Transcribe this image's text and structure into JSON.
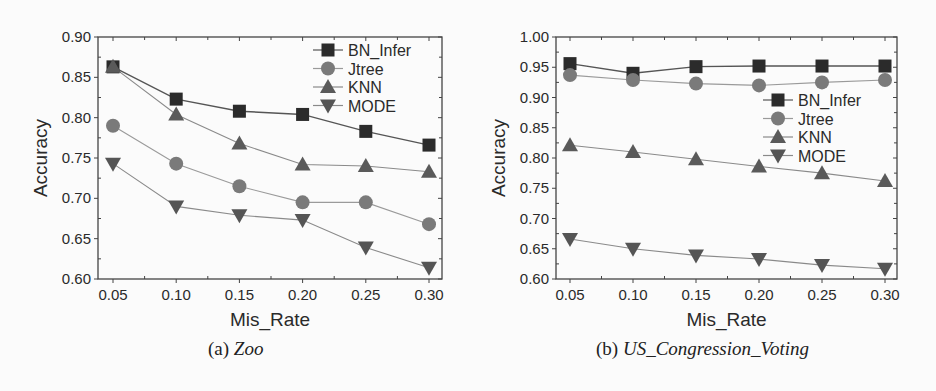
{
  "chart_data": [
    {
      "type": "line",
      "id": "zoo",
      "caption_label": "(a)",
      "caption_name": "Zoo",
      "xlabel": "Mis_Rate",
      "ylabel": "Accuracy",
      "x": [
        0.05,
        0.1,
        0.15,
        0.2,
        0.25,
        0.3
      ],
      "x_tick_labels": [
        "0.05",
        "0.10",
        "0.15",
        "0.20",
        "0.25",
        "0.30"
      ],
      "ylim": [
        0.6,
        0.9
      ],
      "y_ticks": [
        0.6,
        0.65,
        0.7,
        0.75,
        0.8,
        0.85,
        0.9
      ],
      "y_tick_labels": [
        "0.60",
        "0.65",
        "0.70",
        "0.75",
        "0.80",
        "0.85",
        "0.90"
      ],
      "grid": false,
      "legend_position": "upper right",
      "series": [
        {
          "name": "BN_Infer",
          "marker": "square",
          "values": [
            0.863,
            0.823,
            0.808,
            0.804,
            0.783,
            0.766
          ]
        },
        {
          "name": "Jtree",
          "marker": "circle",
          "values": [
            0.79,
            0.743,
            0.715,
            0.695,
            0.695,
            0.668
          ]
        },
        {
          "name": "KNN",
          "marker": "triangle-up",
          "values": [
            0.863,
            0.804,
            0.768,
            0.742,
            0.74,
            0.733
          ]
        },
        {
          "name": "MODE",
          "marker": "triangle-down",
          "values": [
            0.743,
            0.69,
            0.679,
            0.673,
            0.639,
            0.614
          ]
        }
      ]
    },
    {
      "type": "line",
      "id": "us_congression_voting",
      "caption_label": "(b)",
      "caption_name": "US_Congression_Voting",
      "xlabel": "Mis_Rate",
      "ylabel": "Accuracy",
      "x": [
        0.05,
        0.1,
        0.15,
        0.2,
        0.25,
        0.3
      ],
      "x_tick_labels": [
        "0.05",
        "0.10",
        "0.15",
        "0.20",
        "0.25",
        "0.30"
      ],
      "ylim": [
        0.6,
        1.0
      ],
      "y_ticks": [
        0.6,
        0.65,
        0.7,
        0.75,
        0.8,
        0.85,
        0.9,
        0.95,
        1.0
      ],
      "y_tick_labels": [
        "0.60",
        "0.65",
        "0.70",
        "0.75",
        "0.80",
        "0.85",
        "0.90",
        "0.95",
        "1.00"
      ],
      "grid": false,
      "legend_position": "center right",
      "series": [
        {
          "name": "BN_Infer",
          "marker": "square",
          "values": [
            0.956,
            0.94,
            0.951,
            0.952,
            0.952,
            0.952
          ]
        },
        {
          "name": "Jtree",
          "marker": "circle",
          "values": [
            0.937,
            0.929,
            0.923,
            0.92,
            0.925,
            0.929
          ]
        },
        {
          "name": "KNN",
          "marker": "triangle-up",
          "values": [
            0.821,
            0.81,
            0.798,
            0.786,
            0.775,
            0.762
          ]
        },
        {
          "name": "MODE",
          "marker": "triangle-down",
          "values": [
            0.666,
            0.65,
            0.639,
            0.633,
            0.623,
            0.617
          ]
        }
      ]
    }
  ],
  "styles": {
    "series_colors": {
      "BN_Infer": {
        "marker": "#2b2b2b",
        "line": "#555555"
      },
      "Jtree": {
        "marker": "#7a7a7a",
        "line": "#9a9a9a"
      },
      "KNN": {
        "marker": "#5a5a5a",
        "line": "#8a8a8a"
      },
      "MODE": {
        "marker": "#555555",
        "line": "#8a8a8a"
      }
    },
    "axis_color": "#444444",
    "background": "#fbfbfb"
  }
}
